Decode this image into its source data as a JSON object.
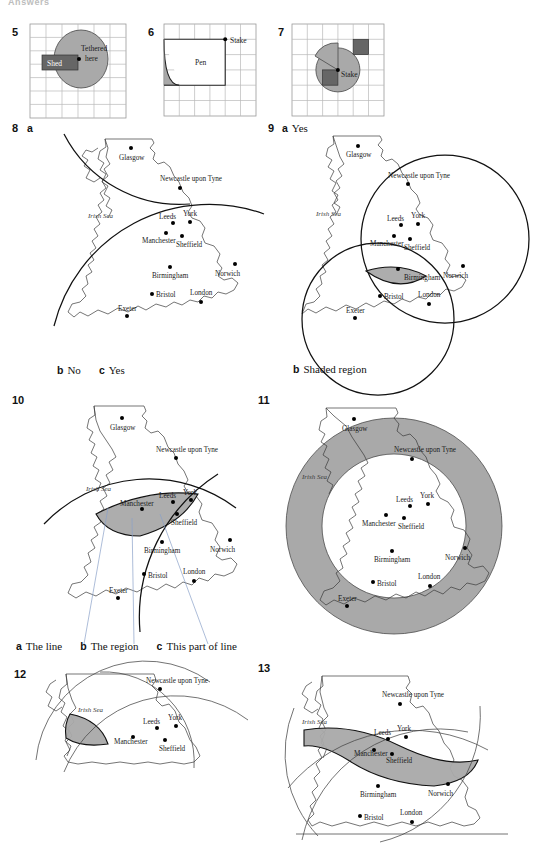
{
  "header": {
    "title": "Answers"
  },
  "cities": {
    "glasgow": "Glasgow",
    "newcastle": "Newcastle upon Tyne",
    "leeds": "Leeds",
    "york": "York",
    "manchester": "Manchester",
    "sheffield": "Sheffield",
    "birmingham": "Birmingham",
    "norwich": "Norwich",
    "bristol": "Bristol",
    "london": "London",
    "exeter": "Exeter",
    "irish_sea": "Irish Sea"
  },
  "figures": [
    {
      "number": "5",
      "type": "grid-diagram",
      "labels": {
        "tethered": "Tethered",
        "here": "here",
        "shed": "Shed"
      },
      "grid": {
        "cols": 6,
        "rows": 7
      },
      "shapes": [
        "shaded-circle",
        "dark-rectangle-shed",
        "tether-point"
      ]
    },
    {
      "number": "6",
      "type": "grid-diagram",
      "labels": {
        "pen": "Pen",
        "stake": "Stake"
      },
      "grid": {
        "cols": 6,
        "rows": 6
      },
      "shapes": [
        "pen-rectangle",
        "quarter-arc",
        "shaded-corner",
        "stake-point"
      ]
    },
    {
      "number": "7",
      "type": "grid-diagram",
      "labels": {
        "stake": "Stake"
      },
      "grid": {
        "cols": 6,
        "rows": 6
      },
      "shapes": [
        "shaded-arc-region",
        "dark-square-upper",
        "dark-square-lower",
        "stake-point"
      ]
    },
    {
      "number": "8",
      "type": "map",
      "part": "a",
      "caption_parts": [
        {
          "letter": "b",
          "text": "No"
        },
        {
          "letter": "c",
          "text": "Yes"
        }
      ],
      "loci": [
        "arc-from-glasgow",
        "arc-across-midlands"
      ]
    },
    {
      "number": "9",
      "type": "map",
      "part": "a",
      "part_answer": "Yes",
      "caption_parts": [
        {
          "letter": "b",
          "text": "Shaded region"
        }
      ],
      "loci": [
        "circle-north",
        "circle-southwest"
      ],
      "shaded": "lens-intersection"
    },
    {
      "number": "10",
      "type": "map",
      "caption_parts": [
        {
          "letter": "a",
          "text": "The line"
        },
        {
          "letter": "b",
          "text": "The region"
        },
        {
          "letter": "c",
          "text": "This part of line"
        }
      ],
      "shaded": "lens-region",
      "loci": [
        "arc-1",
        "arc-2"
      ]
    },
    {
      "number": "11",
      "type": "map",
      "shaded": "annulus-ring",
      "loci": [
        "outer-circle",
        "inner-circle"
      ]
    },
    {
      "number": "12",
      "type": "map",
      "shaded": "small-wedge",
      "loci": [
        "arc-1",
        "arc-2",
        "arc-3"
      ]
    },
    {
      "number": "13",
      "type": "map",
      "shaded": "curved-band",
      "loci": [
        "arc-1",
        "arc-2",
        "arc-3",
        "baseline"
      ]
    }
  ],
  "colors": {
    "shade_gray": "#a9a9a9",
    "dark_box": "#666666",
    "grid_line": "#b9b9b9",
    "coast_line": "#3a3a3a",
    "locus_line": "#111111",
    "leader_line": "#8aa0c8"
  }
}
